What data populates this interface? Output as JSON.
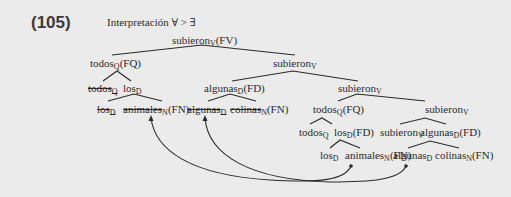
{
  "example_number": "(105)",
  "title": "Interpretación ∀ > ∃",
  "tree": {
    "root": {
      "word": "subieron",
      "sub": "V",
      "tag": "(FV)"
    },
    "l2_left": {
      "word": "todos",
      "sub": "Q",
      "tag": "(FQ)"
    },
    "l2_right": {
      "word": "subieron",
      "sub": "V",
      "tag": ""
    },
    "l3_todos": {
      "word": "todos",
      "sub": "Q",
      "tag": "",
      "struck": true
    },
    "l3_los": {
      "word": "los",
      "sub": "D",
      "tag": ""
    },
    "l3_algunas": {
      "word": "algunas",
      "sub": "D",
      "tag": "(FD)"
    },
    "l3_subieron": {
      "word": "subieron",
      "sub": "V",
      "tag": ""
    },
    "l4_los": {
      "word": "los",
      "sub": "D",
      "tag": "",
      "struck": true
    },
    "l4_animales": {
      "word": "animales",
      "sub": "N",
      "tag": "(FN)",
      "struck": true
    },
    "l4_algunas": {
      "word": "algunas",
      "sub": "D",
      "tag": "",
      "struck": true
    },
    "l4_colinas": {
      "word": "colinas",
      "sub": "N",
      "tag": "(FN)",
      "struck": true
    },
    "l4_todos": {
      "word": "todos",
      "sub": "Q",
      "tag": "(FQ)"
    },
    "l4_subieron": {
      "word": "subieron",
      "sub": "V",
      "tag": ""
    },
    "l5_todos": {
      "word": "todos",
      "sub": "Q",
      "tag": ""
    },
    "l5_los": {
      "word": "los",
      "sub": "D",
      "tag": "(FD)"
    },
    "l5_subieron": {
      "word": "subieron",
      "sub": "V",
      "tag": ""
    },
    "l5_algunas": {
      "word": "algunas",
      "sub": "D",
      "tag": "(FD)"
    },
    "l6_los": {
      "word": "los",
      "sub": "D",
      "tag": ""
    },
    "l6_animales": {
      "word": "animales",
      "sub": "N",
      "tag": "(FN)"
    },
    "l6_algunas": {
      "word": "algunas",
      "sub": "D",
      "tag": ""
    },
    "l6_colinas": {
      "word": "colinas",
      "sub": "N",
      "tag": "(FN)"
    }
  },
  "movement_arrows": [
    {
      "from": "l6_animales",
      "to": "l4_animales"
    },
    {
      "from": "l6_algunas",
      "to": "l4_algunas"
    }
  ],
  "colors": {
    "background": "#ebebeb",
    "ink": "#2a2a2a"
  }
}
